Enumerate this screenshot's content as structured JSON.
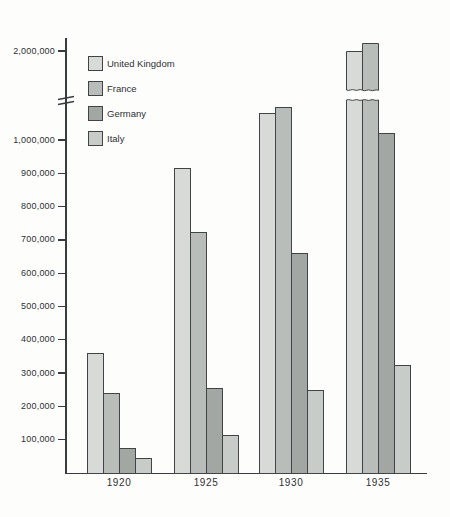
{
  "figure": {
    "title": "",
    "background_color": "#fdfdfc",
    "axis_color": "#383c3e",
    "text_color": "#2d3133",
    "bar_border_color": "#404446"
  },
  "legend": {
    "position": "upper-left-inside",
    "entries": [
      "United Kingdom",
      "France",
      "Germany",
      "Italy"
    ]
  },
  "chart_data": {
    "type": "bar",
    "title": "",
    "xlabel": "",
    "ylabel": "",
    "categories": [
      "1920",
      "1925",
      "1930",
      "1935"
    ],
    "series": [
      {
        "name": "United Kingdom",
        "color": "#d7dad7",
        "values": [
          360000,
          915000,
          1080000,
          2000000
        ]
      },
      {
        "name": "France",
        "color": "#b9bdba",
        "values": [
          240000,
          725000,
          1100000,
          2025000
        ]
      },
      {
        "name": "Germany",
        "color": "#a2a7a4",
        "values": [
          75000,
          255000,
          660000,
          1020000
        ]
      },
      {
        "name": "Italy",
        "color": "#c8ccc9",
        "values": [
          45000,
          115000,
          250000,
          325000
        ]
      }
    ],
    "ytick_values": [
      100000,
      200000,
      300000,
      400000,
      500000,
      600000,
      700000,
      800000,
      900000,
      1000000,
      2000000
    ],
    "ytick_labels": [
      "100,000",
      "200,000",
      "300,000",
      "400,000",
      "500,000",
      "600,000",
      "700,000",
      "800,000",
      "900,000",
      "1,000,000",
      "2,000,000"
    ],
    "ylim": [
      0,
      2100000
    ],
    "axis_break": {
      "present": true,
      "between": [
        1150000,
        1950000
      ]
    },
    "grid": false,
    "legend_position": "upper-left-inside"
  }
}
